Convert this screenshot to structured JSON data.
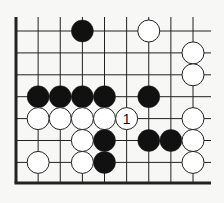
{
  "diagram": {
    "type": "go-board-fragment",
    "colors": {
      "background": "#f7f7f5",
      "line": "#222222",
      "black_stone": "#111111",
      "white_stone": "#ffffff",
      "stone_outline": "#222222"
    },
    "grid": {
      "columns": 9,
      "rows": 7,
      "origin_x": 16,
      "origin_y": 31,
      "spacing_x": 22.125,
      "spacing_y": 21.9,
      "top_open_to": 17,
      "right_open_to": 211,
      "left_edge_thick": true,
      "bottom_edge_y": 183,
      "bottom_edge_thick": true
    },
    "stone_radius": 11,
    "stones": [
      {
        "color": "black",
        "col": 3,
        "row": 0
      },
      {
        "color": "white",
        "col": 6,
        "row": 0
      },
      {
        "color": "white",
        "col": 8,
        "row": 1
      },
      {
        "color": "white",
        "col": 8,
        "row": 2
      },
      {
        "color": "black",
        "col": 1,
        "row": 3
      },
      {
        "color": "black",
        "col": 2,
        "row": 3
      },
      {
        "color": "black",
        "col": 3,
        "row": 3
      },
      {
        "color": "black",
        "col": 4,
        "row": 3
      },
      {
        "color": "black",
        "col": 6,
        "row": 3
      },
      {
        "color": "white",
        "col": 1,
        "row": 4
      },
      {
        "color": "white",
        "col": 2,
        "row": 4
      },
      {
        "color": "white",
        "col": 3,
        "row": 4
      },
      {
        "color": "white",
        "col": 4,
        "row": 4
      },
      {
        "color": "white",
        "col": 5,
        "row": 4,
        "label": "1"
      },
      {
        "color": "white",
        "col": 8,
        "row": 4
      },
      {
        "color": "white",
        "col": 3,
        "row": 5
      },
      {
        "color": "black",
        "col": 4,
        "row": 5
      },
      {
        "color": "black",
        "col": 6,
        "row": 5
      },
      {
        "color": "black",
        "col": 7,
        "row": 5
      },
      {
        "color": "white",
        "col": 8,
        "row": 5
      },
      {
        "color": "white",
        "col": 1,
        "row": 6
      },
      {
        "color": "white",
        "col": 3,
        "row": 6
      },
      {
        "color": "black",
        "col": 4,
        "row": 6
      },
      {
        "color": "white",
        "col": 8,
        "row": 6
      }
    ]
  }
}
